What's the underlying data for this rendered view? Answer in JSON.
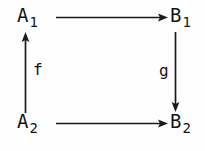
{
  "diagram": {
    "kind": "commutative-square",
    "background_color": "#fefefe",
    "ink_color": "#1a1a1a",
    "vertices": [
      {
        "id": "a1",
        "name": "A1",
        "base": "A",
        "subscript": "1",
        "position": "top-left"
      },
      {
        "id": "b1",
        "name": "B1",
        "base": "B",
        "subscript": "1",
        "position": "top-right"
      },
      {
        "id": "a2",
        "name": "A2",
        "base": "A",
        "subscript": "2",
        "position": "bottom-left"
      },
      {
        "id": "b2",
        "name": "B2",
        "base": "B",
        "subscript": "2",
        "position": "bottom-right"
      }
    ],
    "arrows": [
      {
        "id": "top",
        "from": "A1",
        "to": "B1",
        "direction": "right",
        "label": "",
        "label_position": "none"
      },
      {
        "id": "left",
        "from": "A2",
        "to": "A1",
        "direction": "up",
        "label": "f",
        "label_position": "right-of-arrow"
      },
      {
        "id": "right",
        "from": "B1",
        "to": "B2",
        "direction": "down",
        "label": "g",
        "label_position": "left-of-arrow"
      },
      {
        "id": "bottom",
        "from": "A2",
        "to": "B2",
        "direction": "right",
        "label": "",
        "label_position": "none"
      }
    ],
    "labels": {
      "f": "f",
      "g": "g"
    }
  }
}
